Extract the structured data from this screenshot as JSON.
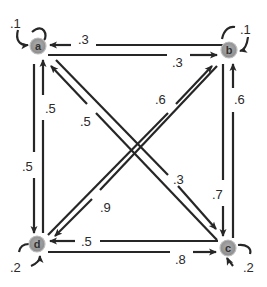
{
  "diagram": {
    "type": "markov-chain-state-transition",
    "colors": {
      "edge": "#262626",
      "node_fill": "#9e9e9e",
      "node_stroke": "#b8b8b8",
      "background": "#ffffff"
    },
    "nodes": [
      {
        "id": "a",
        "label": "a",
        "x": 38,
        "y": 46
      },
      {
        "id": "b",
        "label": "b",
        "x": 229,
        "y": 50
      },
      {
        "id": "c",
        "label": "c",
        "x": 228,
        "y": 248
      },
      {
        "id": "d",
        "label": "d",
        "x": 37,
        "y": 244
      }
    ],
    "edges": [
      {
        "from": "a",
        "to": "a",
        "prob": ".1"
      },
      {
        "from": "b",
        "to": "b",
        "prob": ".1"
      },
      {
        "from": "c",
        "to": "c",
        "prob": ".2"
      },
      {
        "from": "d",
        "to": "d",
        "prob": ".2"
      },
      {
        "from": "b",
        "to": "a",
        "prob": ".3"
      },
      {
        "from": "a",
        "to": "b",
        "prob": ".3"
      },
      {
        "from": "a",
        "to": "d",
        "prob": ".5"
      },
      {
        "from": "d",
        "to": "a",
        "prob": ".5"
      },
      {
        "from": "b",
        "to": "c",
        "prob": ".7"
      },
      {
        "from": "c",
        "to": "b",
        "prob": ".6"
      },
      {
        "from": "c",
        "to": "d",
        "prob": ".5"
      },
      {
        "from": "d",
        "to": "c",
        "prob": ".8"
      },
      {
        "from": "c",
        "to": "a",
        "prob": ".5"
      },
      {
        "from": "a",
        "to": "c",
        "prob": ".3"
      },
      {
        "from": "d",
        "to": "b",
        "prob": ".6"
      },
      {
        "from": "b",
        "to": "d",
        "prob": ".9"
      }
    ]
  }
}
